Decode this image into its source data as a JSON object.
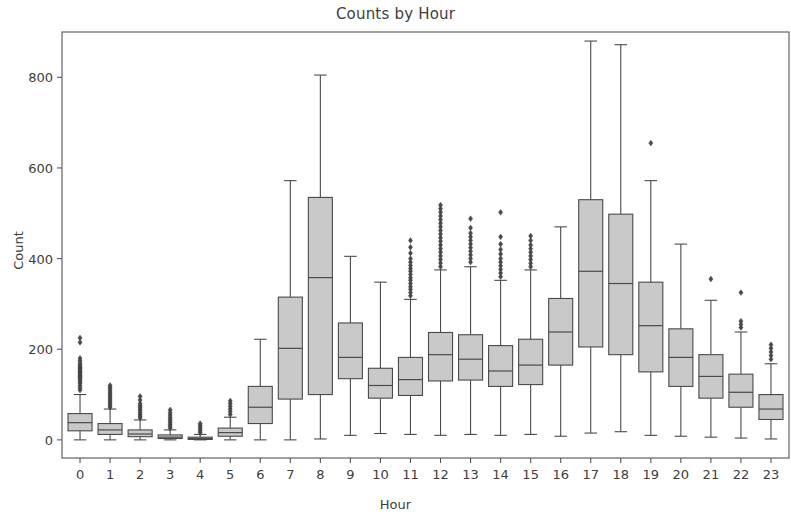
{
  "chart_data": {
    "type": "box",
    "title": "Counts by Hour",
    "xlabel": "Hour",
    "ylabel": "Count",
    "grid": false,
    "legend": null,
    "xlim": [
      -0.6,
      23.6
    ],
    "ylim": [
      -40,
      900
    ],
    "ytick_labels": [
      "0",
      "200",
      "400",
      "600",
      "800"
    ],
    "ytick_values": [
      0,
      200,
      400,
      600,
      800
    ],
    "xtick_labels": [
      "0",
      "1",
      "2",
      "3",
      "4",
      "5",
      "6",
      "7",
      "8",
      "9",
      "10",
      "11",
      "12",
      "13",
      "14",
      "15",
      "16",
      "17",
      "18",
      "19",
      "20",
      "21",
      "22",
      "23"
    ],
    "categories": [
      0,
      1,
      2,
      3,
      4,
      5,
      6,
      7,
      8,
      9,
      10,
      11,
      12,
      13,
      14,
      15,
      16,
      17,
      18,
      19,
      20,
      21,
      22,
      23
    ],
    "box_fill": "#c9c9c9",
    "box_edge": "#4a4a4a",
    "boxes": [
      {
        "hour": 0,
        "whisker_low": 0,
        "q1": 20,
        "median": 38,
        "q3": 58,
        "whisker_high": 100,
        "outliers": [
          110,
          115,
          120,
          125,
          128,
          132,
          135,
          138,
          140,
          142,
          145,
          148,
          150,
          152,
          155,
          158,
          160,
          163,
          166,
          170,
          175,
          180,
          215,
          225
        ]
      },
      {
        "hour": 1,
        "whisker_low": 0,
        "q1": 12,
        "median": 22,
        "q3": 36,
        "whisker_high": 68,
        "outliers": [
          72,
          76,
          80,
          84,
          88,
          92,
          96,
          100,
          104,
          108,
          112,
          116,
          120
        ]
      },
      {
        "hour": 2,
        "whisker_low": 0,
        "q1": 7,
        "median": 13,
        "q3": 22,
        "whisker_high": 44,
        "outliers": [
          48,
          52,
          56,
          60,
          64,
          68,
          72,
          76,
          80,
          88,
          96
        ]
      },
      {
        "hour": 3,
        "whisker_low": 0,
        "q1": 3,
        "median": 6,
        "q3": 11,
        "whisker_high": 22,
        "outliers": [
          26,
          30,
          34,
          38,
          42,
          46,
          50,
          55,
          60,
          66
        ]
      },
      {
        "hour": 4,
        "whisker_low": 0,
        "q1": 1,
        "median": 3,
        "q3": 6,
        "whisker_high": 12,
        "outliers": [
          16,
          20,
          24,
          28,
          32,
          36
        ]
      },
      {
        "hour": 5,
        "whisker_low": 0,
        "q1": 8,
        "median": 16,
        "q3": 26,
        "whisker_high": 50,
        "outliers": [
          56,
          62,
          68,
          74,
          80,
          86
        ]
      },
      {
        "hour": 6,
        "whisker_low": 0,
        "q1": 36,
        "median": 72,
        "q3": 118,
        "whisker_high": 222,
        "outliers": []
      },
      {
        "hour": 7,
        "whisker_low": 0,
        "q1": 90,
        "median": 202,
        "q3": 315,
        "whisker_high": 572,
        "outliers": []
      },
      {
        "hour": 8,
        "whisker_low": 2,
        "q1": 100,
        "median": 358,
        "q3": 535,
        "whisker_high": 805,
        "outliers": []
      },
      {
        "hour": 9,
        "whisker_low": 10,
        "q1": 135,
        "median": 182,
        "q3": 258,
        "whisker_high": 405,
        "outliers": []
      },
      {
        "hour": 10,
        "whisker_low": 14,
        "q1": 92,
        "median": 120,
        "q3": 158,
        "whisker_high": 348,
        "outliers": []
      },
      {
        "hour": 11,
        "whisker_low": 12,
        "q1": 98,
        "median": 133,
        "q3": 182,
        "whisker_high": 310,
        "outliers": [
          318,
          325,
          332,
          338,
          345,
          352,
          358,
          365,
          372,
          378,
          385,
          392,
          400,
          412,
          425,
          440
        ]
      },
      {
        "hour": 12,
        "whisker_low": 10,
        "q1": 130,
        "median": 188,
        "q3": 237,
        "whisker_high": 375,
        "outliers": [
          382,
          390,
          398,
          406,
          414,
          422,
          430,
          438,
          446,
          454,
          462,
          470,
          478,
          486,
          494,
          502,
          510,
          518
        ]
      },
      {
        "hour": 13,
        "whisker_low": 12,
        "q1": 132,
        "median": 178,
        "q3": 232,
        "whisker_high": 382,
        "outliers": [
          392,
          400,
          408,
          416,
          424,
          432,
          440,
          448,
          456,
          468,
          488
        ]
      },
      {
        "hour": 14,
        "whisker_low": 10,
        "q1": 118,
        "median": 152,
        "q3": 208,
        "whisker_high": 352,
        "outliers": [
          360,
          368,
          376,
          384,
          392,
          400,
          410,
          420,
          432,
          448,
          502
        ]
      },
      {
        "hour": 15,
        "whisker_low": 12,
        "q1": 122,
        "median": 165,
        "q3": 222,
        "whisker_high": 375,
        "outliers": [
          382,
          390,
          398,
          406,
          414,
          422,
          430,
          440,
          450
        ]
      },
      {
        "hour": 16,
        "whisker_low": 8,
        "q1": 165,
        "median": 238,
        "q3": 312,
        "whisker_high": 470,
        "outliers": []
      },
      {
        "hour": 17,
        "whisker_low": 15,
        "q1": 205,
        "median": 372,
        "q3": 530,
        "whisker_high": 880,
        "outliers": []
      },
      {
        "hour": 18,
        "whisker_low": 18,
        "q1": 188,
        "median": 345,
        "q3": 498,
        "whisker_high": 872,
        "outliers": []
      },
      {
        "hour": 19,
        "whisker_low": 10,
        "q1": 150,
        "median": 252,
        "q3": 348,
        "whisker_high": 572,
        "outliers": [
          655
        ]
      },
      {
        "hour": 20,
        "whisker_low": 8,
        "q1": 118,
        "median": 182,
        "q3": 245,
        "whisker_high": 432,
        "outliers": []
      },
      {
        "hour": 21,
        "whisker_low": 6,
        "q1": 92,
        "median": 140,
        "q3": 188,
        "whisker_high": 308,
        "outliers": [
          355
        ]
      },
      {
        "hour": 22,
        "whisker_low": 4,
        "q1": 72,
        "median": 105,
        "q3": 145,
        "whisker_high": 238,
        "outliers": [
          248,
          255,
          262,
          325
        ]
      },
      {
        "hour": 23,
        "whisker_low": 2,
        "q1": 45,
        "median": 68,
        "q3": 100,
        "whisker_high": 168,
        "outliers": [
          178,
          186,
          194,
          202,
          210
        ]
      }
    ]
  }
}
